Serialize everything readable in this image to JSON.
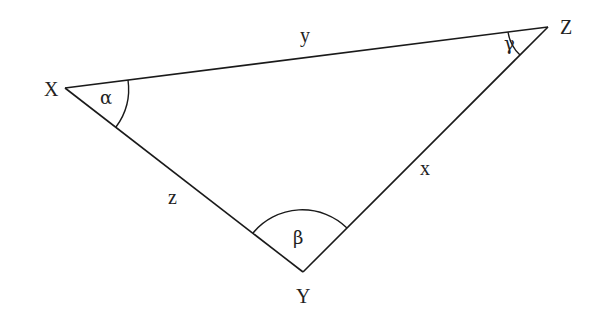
{
  "diagram": {
    "type": "triangle",
    "vertices": {
      "X": {
        "label": "X",
        "angle_label": "α"
      },
      "Y": {
        "label": "Y",
        "angle_label": "β"
      },
      "Z": {
        "label": "Z",
        "angle_label": "γ"
      }
    },
    "sides": {
      "XZ": {
        "label": "y"
      },
      "ZY": {
        "label": "x"
      },
      "XY": {
        "label": "z"
      }
    },
    "colors": {
      "stroke": "#1a1a1a",
      "text": "#222222",
      "background": "#ffffff"
    }
  }
}
